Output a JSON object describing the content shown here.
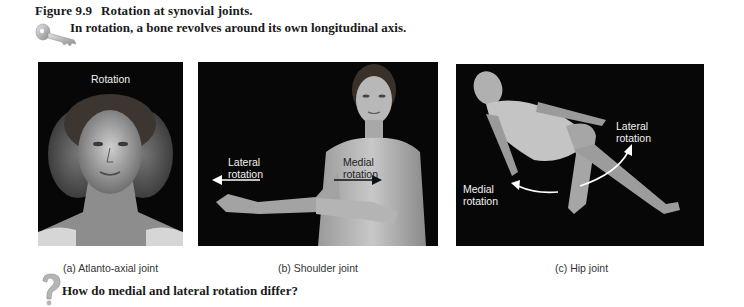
{
  "figure": {
    "number": "Figure 9.9",
    "title": "Rotation at synovial joints.",
    "key_point": "In rotation, a bone revolves around its own longitudinal axis.",
    "key_icon": "key-icon",
    "question_icon": "question-mark-icon",
    "question": "How do medial and lateral rotation differ?"
  },
  "panels": [
    {
      "id": "a",
      "caption": "(a) Atlanto-axial joint",
      "labels": [
        "Rotation"
      ],
      "image": "photo of head rotating left and right (multiple exposure)"
    },
    {
      "id": "b",
      "caption": "(b) Shoulder joint",
      "labels": [
        "Lateral",
        "rotation",
        "Medial",
        "rotation"
      ],
      "arrows": [
        {
          "label": "Lateral rotation",
          "direction": "left",
          "color": "#ffffff"
        },
        {
          "label": "Medial rotation",
          "direction": "right",
          "color": "#111111"
        }
      ],
      "image": "photo of woman rotating arm at shoulder"
    },
    {
      "id": "c",
      "caption": "(c) Hip joint",
      "labels": [
        "Lateral",
        "rotation",
        "Medial",
        "rotation"
      ],
      "arrows": [
        {
          "label": "Lateral rotation",
          "direction": "up-right curved",
          "color": "#ffffff"
        },
        {
          "label": "Medial rotation",
          "direction": "left curved",
          "color": "#ffffff"
        }
      ],
      "image": "photo of reclining woman rotating leg at hip"
    }
  ]
}
